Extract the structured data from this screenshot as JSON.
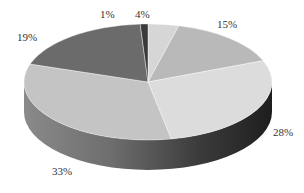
{
  "chart_data": {
    "type": "pie",
    "style": "3d",
    "title": "",
    "start_angle": "12 o'clock",
    "direction": "clockwise",
    "slices": [
      {
        "label": "4%",
        "value": 4,
        "color": "#d6d6d6"
      },
      {
        "label": "15%",
        "value": 15,
        "color": "#b9b9b9"
      },
      {
        "label": "28%",
        "value": 28,
        "color": "#dcdcdc"
      },
      {
        "label": "33%",
        "value": 33,
        "color": "#c4c4c4"
      },
      {
        "label": "19%",
        "value": 19,
        "color": "#6b6b6b"
      },
      {
        "label": "1%",
        "value": 1,
        "color": "#3a3a3a"
      }
    ],
    "legend": "none",
    "data_labels": "outside"
  },
  "labels": {
    "l4": "4%",
    "l15": "15%",
    "l28": "28%",
    "l33": "33%",
    "l19": "19%",
    "l1": "1%"
  }
}
